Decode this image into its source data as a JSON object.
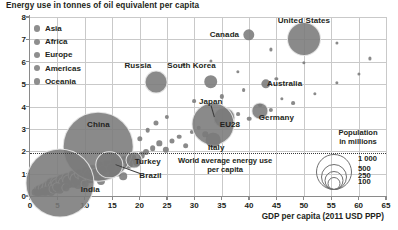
{
  "chart_data": {
    "type": "scatter",
    "title": "Energy use in tonnes of oil equivalent per capita",
    "xlabel": "GDP per capita (2011 USD PPP)",
    "ylabel": "Energy use in tonnes of oil equivalent per capita",
    "xlim": [
      0,
      65
    ],
    "ylim": [
      0,
      8
    ],
    "xticks": [
      "0",
      "5",
      "10",
      "15",
      "20",
      "25",
      "30",
      "35",
      "40",
      "45",
      "50",
      "55",
      "60",
      "65"
    ],
    "yticks": [
      "0",
      "1",
      "2",
      "3",
      "4",
      "5",
      "6",
      "7",
      "8"
    ],
    "grid": true,
    "legend_position": "top-left",
    "size_encoding": "Population in millions",
    "annotations": [
      {
        "text": "World average energy use per capita",
        "y_value": 1.9
      }
    ],
    "labeled_points": [
      {
        "name": "United States",
        "x": 50.0,
        "y": 7.0,
        "population": 320,
        "region": "Americas"
      },
      {
        "name": "Canada",
        "x": 40.0,
        "y": 7.2,
        "population": 36,
        "region": "Americas"
      },
      {
        "name": "Russia",
        "x": 23.0,
        "y": 5.1,
        "population": 144,
        "region": "Europe"
      },
      {
        "name": "South Korea",
        "x": 33.0,
        "y": 5.1,
        "population": 51,
        "region": "Asia"
      },
      {
        "name": "Australia",
        "x": 43.0,
        "y": 5.0,
        "population": 24,
        "region": "Oceania"
      },
      {
        "name": "Japan",
        "x": 35.5,
        "y": 3.5,
        "population": 127,
        "region": "Asia"
      },
      {
        "name": "Germany",
        "x": 42.0,
        "y": 3.8,
        "population": 82,
        "region": "Europe"
      },
      {
        "name": "EU28",
        "x": 33.5,
        "y": 3.2,
        "population": 510,
        "region": "Europe"
      },
      {
        "name": "Italy",
        "x": 33.5,
        "y": 2.5,
        "population": 60,
        "region": "Europe"
      },
      {
        "name": "China",
        "x": 12.5,
        "y": 2.2,
        "population": 1380,
        "region": "Asia"
      },
      {
        "name": "Turkey",
        "x": 19.0,
        "y": 1.6,
        "population": 79,
        "region": "Asia"
      },
      {
        "name": "Brazil",
        "x": 14.5,
        "y": 1.4,
        "population": 208,
        "region": "Americas"
      },
      {
        "name": "India",
        "x": 5.5,
        "y": 0.6,
        "population": 1320,
        "region": "Asia"
      }
    ],
    "series": [
      {
        "name": "Asia",
        "color": "#8e8e8e"
      },
      {
        "name": "Africa",
        "color": "#8e8e8e"
      },
      {
        "name": "Europe",
        "color": "#8e8e8e"
      },
      {
        "name": "Americas",
        "color": "#8e8e8e"
      },
      {
        "name": "Oceania",
        "color": "#8e8e8e"
      }
    ]
  },
  "legend": {
    "items": [
      {
        "label": "Asia"
      },
      {
        "label": "Africa"
      },
      {
        "label": "Europe"
      },
      {
        "label": "Americas"
      },
      {
        "label": "Oceania"
      }
    ]
  },
  "size_legend": {
    "title_line1": "Population",
    "title_line2": "in millions",
    "labels": [
      "1 000",
      "500",
      "250",
      "100"
    ]
  },
  "annotation": {
    "world_line1": "World average energy use",
    "world_line2": "per capita"
  },
  "axes": {
    "x_title": "GDP per capita (2011 USD PPP)",
    "x_ticks": [
      "0",
      "5",
      "10",
      "15",
      "20",
      "25",
      "30",
      "35",
      "40",
      "45",
      "50",
      "55",
      "60",
      "65"
    ],
    "y_ticks": [
      "8",
      "7",
      "6",
      "5",
      "4",
      "3",
      "2",
      "1",
      "0"
    ]
  },
  "title": "Energy use in tonnes of oil equivalent per capita",
  "points": {
    "united_states": "United States",
    "canada": "Canada",
    "russia": "Russia",
    "south_korea": "South Korea",
    "australia": "Australia",
    "japan": "Japan",
    "germany": "Germany",
    "eu28": "EU28",
    "italy": "Italy",
    "china": "China",
    "turkey": "Turkey",
    "brazil": "Brazil",
    "india": "India"
  }
}
